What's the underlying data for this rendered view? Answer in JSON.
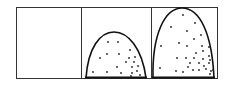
{
  "diagram": {
    "stroke_color": "#111111",
    "background": "#ffffff",
    "panels": [
      {
        "name": "empty",
        "dots": []
      },
      {
        "name": "small-dome",
        "dots": [
          [
            108,
            42
          ],
          [
            118,
            42
          ],
          [
            107,
            54
          ],
          [
            119,
            54
          ],
          [
            130,
            50
          ],
          [
            100,
            58
          ],
          [
            129,
            58
          ],
          [
            135,
            57
          ],
          [
            126,
            62
          ],
          [
            134,
            62
          ],
          [
            117,
            67
          ],
          [
            132,
            67
          ],
          [
            138,
            66
          ],
          [
            93,
            72
          ],
          [
            107,
            72
          ],
          [
            121,
            73
          ],
          [
            132,
            73
          ],
          [
            137,
            71
          ],
          [
            140,
            75
          ],
          [
            131,
            76
          ]
        ]
      },
      {
        "name": "large-dome",
        "dots": [
          [
            183,
            15
          ],
          [
            195,
            23
          ],
          [
            171,
            27
          ],
          [
            187,
            31
          ],
          [
            201,
            35
          ],
          [
            194,
            39
          ],
          [
            179,
            43
          ],
          [
            161,
            46
          ],
          [
            187,
            46
          ],
          [
            202,
            46
          ],
          [
            209,
            47
          ],
          [
            196,
            53
          ],
          [
            203,
            51
          ],
          [
            209,
            56
          ],
          [
            177,
            58
          ],
          [
            186,
            58
          ],
          [
            194,
            58
          ],
          [
            203,
            59
          ],
          [
            210,
            60
          ],
          [
            190,
            63
          ],
          [
            199,
            63
          ],
          [
            204,
            66
          ],
          [
            209,
            63
          ],
          [
            160,
            68
          ],
          [
            176,
            71
          ],
          [
            188,
            67
          ],
          [
            193,
            70
          ],
          [
            199,
            70
          ],
          [
            206,
            69
          ],
          [
            211,
            71
          ],
          [
            183,
            72
          ],
          [
            210,
            74
          ],
          [
            213,
            70
          ]
        ]
      }
    ]
  }
}
